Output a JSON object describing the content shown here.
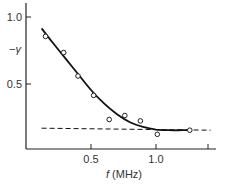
{
  "chart_data": {
    "type": "scatter",
    "title": "",
    "xlabel": "f (MHz)",
    "xlabel_italic_part": "f",
    "xlabel_unit": "(MHz)",
    "ylabel": "−γ",
    "xlim": [
      0,
      1.45
    ],
    "ylim": [
      0,
      1.05
    ],
    "x_ticks": [
      0.5,
      1.0,
      1.4
    ],
    "x_tick_labels": [
      "0.5",
      "1.0",
      ""
    ],
    "y_ticks": [
      0.5,
      1.0
    ],
    "y_tick_labels": [
      "0.5",
      "1.0"
    ],
    "grid": false,
    "legend": null,
    "series": [
      {
        "name": "measured",
        "style": "open-circle markers",
        "x": [
          0.15,
          0.29,
          0.4,
          0.52,
          0.64,
          0.76,
          0.88,
          1.01,
          1.26
        ],
        "y": [
          0.84,
          0.72,
          0.545,
          0.4,
          0.22,
          0.25,
          0.21,
          0.11,
          0.14
        ]
      },
      {
        "name": "fitted curve",
        "style": "solid line",
        "x": [
          0.12,
          0.2,
          0.3,
          0.4,
          0.5,
          0.6,
          0.7,
          0.8,
          0.9,
          1.0,
          1.1,
          1.2,
          1.26
        ],
        "y": [
          0.9,
          0.8,
          0.68,
          0.56,
          0.44,
          0.34,
          0.26,
          0.2,
          0.165,
          0.145,
          0.14,
          0.14,
          0.14
        ]
      },
      {
        "name": "asymptote",
        "style": "dashed line",
        "x": [
          0.12,
          1.42
        ],
        "y": [
          0.155,
          0.14
        ]
      }
    ]
  },
  "labels": {
    "y_axis": "−γ",
    "x_axis_var": "f",
    "x_axis_unit": " (MHz)",
    "y_tick_1": "1.0",
    "y_tick_05": "0.5",
    "x_tick_05": "0.5",
    "x_tick_1": "1.0"
  }
}
